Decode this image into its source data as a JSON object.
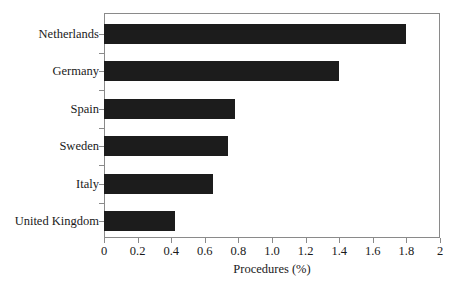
{
  "figure": {
    "top_cropped_text": "",
    "background_color": "#ffffff",
    "frame_color": "#8a8a8a",
    "bar_color": "#1c1c1c",
    "text_color": "#1a1a1a"
  },
  "chart_data": {
    "type": "bar",
    "orientation": "horizontal",
    "title": "",
    "xlabel": "Procedures (%)",
    "ylabel": "",
    "categories": [
      "Netherlands",
      "Germany",
      "Spain",
      "Sweden",
      "Italy",
      "United Kingdom"
    ],
    "values": [
      1.8,
      1.4,
      0.78,
      0.74,
      0.65,
      0.42
    ],
    "xlim": [
      0,
      2
    ],
    "ylim": null,
    "xticks": [
      0,
      0.2,
      0.4,
      0.6,
      0.8,
      1.0,
      1.2,
      1.4,
      1.6,
      1.8,
      2
    ],
    "xtick_labels": [
      "0",
      "0.2",
      "0.4",
      "0.6",
      "0.8",
      "1.0",
      "1.2",
      "1.4",
      "1.6",
      "1.8",
      "2"
    ],
    "grid": false,
    "legend": null,
    "legend_position": "none",
    "annotations": []
  }
}
